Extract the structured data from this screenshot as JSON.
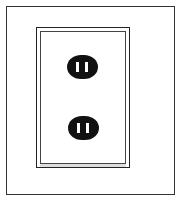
{
  "illustration": {
    "subject": "wall outlet",
    "outlets": [
      {
        "position": "top",
        "type": "two-prong"
      },
      {
        "position": "bottom",
        "type": "two-prong"
      }
    ],
    "colors": {
      "line": "#222222",
      "socket": "#111111",
      "background": "#ffffff"
    }
  }
}
